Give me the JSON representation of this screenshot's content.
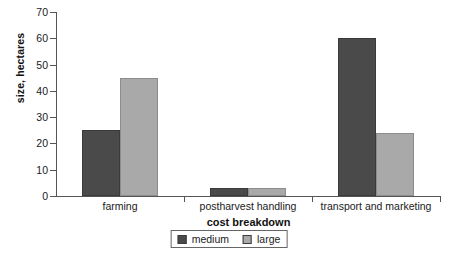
{
  "chart_data": {
    "type": "bar",
    "title": "",
    "subtitle": "",
    "xlabel": "cost breakdown",
    "ylabel": "size, hectares",
    "categories": [
      "farming",
      "postharvest handling",
      "transport and marketing"
    ],
    "series": [
      {
        "name": "medium",
        "color": "#4a4a4a",
        "values": [
          25,
          3,
          60
        ]
      },
      {
        "name": "large",
        "color": "#a9a9a9",
        "values": [
          45,
          3,
          24
        ]
      }
    ],
    "ylim": [
      0,
      70
    ],
    "ytick_labels": [
      "0",
      "10",
      "20",
      "30",
      "40",
      "50",
      "60",
      "70"
    ],
    "ytick_values": [
      0,
      10,
      20,
      30,
      40,
      50,
      60,
      70
    ],
    "grid": false,
    "legend_position": "bottom-center",
    "legend_entries": [
      "medium",
      "large"
    ]
  },
  "axes": {
    "y_title": "size, hectares",
    "x_title": "cost breakdown"
  }
}
